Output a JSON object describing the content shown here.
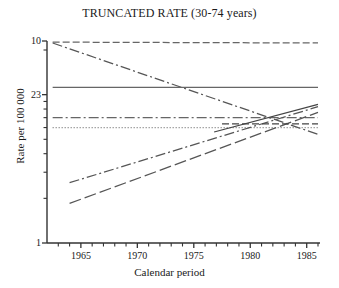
{
  "chart_data": {
    "type": "line",
    "title": "TRUNCATED RATE (30-74 years)",
    "xlabel": "Calendar period",
    "ylabel": "Rate per 100 000",
    "xlim": [
      1962,
      1986
    ],
    "ylim": [
      1,
      23
    ],
    "yscale": "log",
    "grid": false,
    "legend": "none",
    "xticks": [
      1965,
      1970,
      1975,
      1980,
      1985
    ],
    "xtick_labels": [
      "1965",
      "1970",
      "1975",
      "1980",
      "1985"
    ],
    "xminor_ticks": [
      1963,
      1964,
      1966,
      1967,
      1968,
      1969,
      1971,
      1972,
      1973,
      1974,
      1976,
      1977,
      1978,
      1979,
      1981,
      1982,
      1983,
      1984,
      1986
    ],
    "yticks": [
      1,
      23,
      10
    ],
    "ytick_labels": [
      "1",
      "10",
      "23"
    ],
    "yminor_ticks": [
      2,
      3,
      4,
      5,
      6,
      7,
      8,
      9,
      20
    ],
    "series": [
      {
        "name": "series-1-top-dashed",
        "style": "dashed",
        "color": "#666666",
        "x": [
          1962.5,
          1986
        ],
        "y": [
          22.6,
          22.3
        ]
      },
      {
        "name": "series-2-declining-dashdot",
        "style": "dash-dot",
        "color": "#555555",
        "x": [
          1962.5,
          1986
        ],
        "y": [
          22.3,
          5.4
        ]
      },
      {
        "name": "series-3-flat-solid",
        "style": "solid",
        "color": "#666666",
        "x": [
          1962.5,
          1986
        ],
        "y": [
          11.2,
          11.2
        ]
      },
      {
        "name": "series-4-flat-dashdot",
        "style": "dash-dot",
        "color": "#666666",
        "x": [
          1962.5,
          1986
        ],
        "y": [
          7.0,
          7.0
        ]
      },
      {
        "name": "series-5-flat-dotted",
        "style": "dotted",
        "color": "#777777",
        "x": [
          1962.5,
          1986
        ],
        "y": [
          6.0,
          6.0
        ]
      },
      {
        "name": "series-6-rising-dashdot",
        "style": "dash-dot",
        "color": "#555555",
        "x": [
          1964,
          1986
        ],
        "y": [
          2.55,
          8.3
        ]
      },
      {
        "name": "series-7-rising-longdash",
        "style": "long-dash",
        "color": "#555555",
        "x": [
          1964,
          1986
        ],
        "y": [
          1.85,
          7.6
        ]
      },
      {
        "name": "series-8-rising-solid",
        "style": "solid",
        "color": "#444444",
        "x": [
          1976.8,
          1986
        ],
        "y": [
          5.6,
          8.6
        ]
      },
      {
        "name": "series-9-dashed-flat-right",
        "style": "dashed",
        "color": "#444444",
        "x": [
          1977.5,
          1986
        ],
        "y": [
          6.35,
          6.35
        ]
      }
    ],
    "axis_color": "#333333",
    "background_color": "#ffffff"
  }
}
